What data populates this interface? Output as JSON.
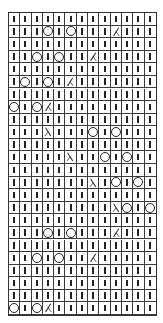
{
  "chart": {
    "title": "",
    "columns": 13,
    "rows": 24,
    "legend_symbols": {
      "knit": "vertical bar (knit stitch)",
      "yo": "circle (yarn over)",
      "k2tog": "right-leaning slash (k2tog)",
      "ssk": "left-leaning slash (ssk)"
    },
    "colors": {
      "line": "#333333",
      "symbol": "#222222",
      "background": "#ffffff"
    },
    "grid": [
      [
        "k",
        "k",
        "k",
        "k",
        "k",
        "k",
        "k",
        "k",
        "k",
        "k",
        "k",
        "k",
        "k"
      ],
      [
        "k",
        "k",
        "k",
        "o",
        "k",
        "o",
        "k",
        "k",
        "k",
        "r",
        "k",
        "k",
        "k"
      ],
      [
        "k",
        "k",
        "k",
        "k",
        "k",
        "k",
        "k",
        "k",
        "k",
        "k",
        "k",
        "k",
        "k"
      ],
      [
        "k",
        "k",
        "o",
        "k",
        "o",
        "k",
        "k",
        "r",
        "k",
        "k",
        "k",
        "k",
        "k"
      ],
      [
        "k",
        "k",
        "k",
        "k",
        "k",
        "k",
        "k",
        "k",
        "k",
        "k",
        "k",
        "k",
        "k"
      ],
      [
        "k",
        "o",
        "k",
        "o",
        "k",
        "r",
        "k",
        "k",
        "k",
        "k",
        "k",
        "k",
        "k"
      ],
      [
        "k",
        "k",
        "k",
        "k",
        "k",
        "k",
        "k",
        "k",
        "k",
        "k",
        "k",
        "k",
        "k"
      ],
      [
        "o",
        "k",
        "o",
        "r",
        "k",
        "k",
        "k",
        "k",
        "k",
        "k",
        "k",
        "k",
        "k"
      ],
      [
        "k",
        "k",
        "k",
        "k",
        "k",
        "k",
        "k",
        "k",
        "k",
        "k",
        "k",
        "k",
        "k"
      ],
      [
        "k",
        "k",
        "k",
        "l",
        "k",
        "k",
        "k",
        "o",
        "k",
        "o",
        "k",
        "k",
        "k"
      ],
      [
        "k",
        "k",
        "k",
        "k",
        "k",
        "k",
        "k",
        "k",
        "k",
        "k",
        "k",
        "k",
        "k"
      ],
      [
        "k",
        "k",
        "k",
        "k",
        "k",
        "l",
        "k",
        "k",
        "o",
        "k",
        "o",
        "k",
        "k"
      ],
      [
        "k",
        "k",
        "k",
        "k",
        "k",
        "k",
        "k",
        "k",
        "k",
        "k",
        "k",
        "k",
        "k"
      ],
      [
        "k",
        "k",
        "k",
        "k",
        "k",
        "k",
        "k",
        "l",
        "k",
        "o",
        "k",
        "o",
        "k"
      ],
      [
        "k",
        "k",
        "k",
        "k",
        "k",
        "k",
        "k",
        "k",
        "k",
        "k",
        "k",
        "k",
        "k"
      ],
      [
        "k",
        "k",
        "k",
        "k",
        "k",
        "k",
        "k",
        "k",
        "k",
        "l",
        "o",
        "k",
        "o"
      ],
      [
        "k",
        "k",
        "k",
        "k",
        "k",
        "k",
        "k",
        "k",
        "k",
        "k",
        "k",
        "k",
        "k"
      ],
      [
        "k",
        "k",
        "k",
        "o",
        "k",
        "o",
        "k",
        "k",
        "k",
        "r",
        "k",
        "k",
        "k"
      ],
      [
        "k",
        "k",
        "k",
        "k",
        "k",
        "k",
        "k",
        "k",
        "k",
        "k",
        "k",
        "k",
        "k"
      ],
      [
        "k",
        "k",
        "o",
        "k",
        "o",
        "k",
        "k",
        "r",
        "k",
        "k",
        "k",
        "k",
        "k"
      ],
      [
        "k",
        "k",
        "k",
        "k",
        "k",
        "k",
        "k",
        "k",
        "k",
        "k",
        "k",
        "k",
        "k"
      ],
      [
        "k",
        "k",
        "k",
        "k",
        "k",
        "k",
        "k",
        "k",
        "k",
        "k",
        "k",
        "k",
        "k"
      ],
      [
        "k",
        "k",
        "k",
        "k",
        "k",
        "k",
        "k",
        "k",
        "k",
        "k",
        "k",
        "k",
        "k"
      ],
      [
        "o",
        "k",
        "o",
        "r",
        "k",
        "k",
        "k",
        "k",
        "k",
        "k",
        "k",
        "k",
        "k"
      ]
    ]
  }
}
